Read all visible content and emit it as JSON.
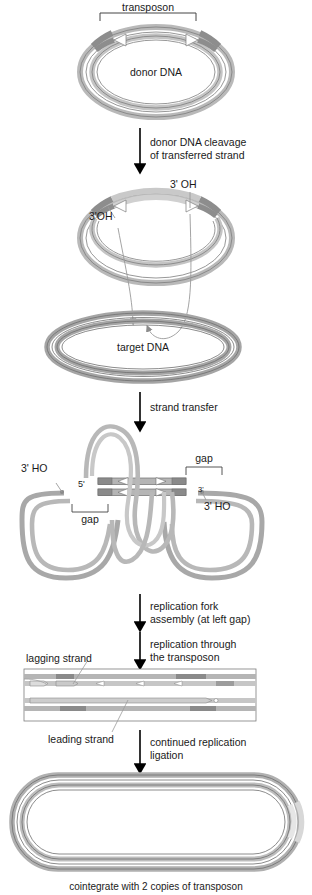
{
  "figure": {
    "title_caption": "cointegrate with 2 copies of transposon",
    "colors": {
      "dna_light": "#cfcfcf",
      "dna_mid": "#a8a8a8",
      "dna_dark": "#8a8a8a",
      "transposon_dark": "#8f8f8f",
      "outline": "#6e6e6e",
      "text": "#1a1a1a",
      "arrow": "#000000",
      "thin_leader": "#9a9a9a"
    }
  },
  "stage1": {
    "transposon_label": "transposon",
    "donor_label": "donor DNA"
  },
  "step1": {
    "line1": "donor DNA cleavage",
    "line2": "of transferred strand"
  },
  "stage2": {
    "oh_right": "3' OH",
    "oh_left": "3'OH",
    "target_label": "target DNA"
  },
  "step2": {
    "line1": "strand transfer"
  },
  "stage3": {
    "ho_left": "3' HO",
    "five_prime": "5'",
    "gap_left": "gap",
    "gap_right": "gap",
    "three_prime": "3'",
    "ho_right": "3' HO"
  },
  "step3": {
    "line1": "replication fork",
    "line2": "assembly (at left gap)"
  },
  "step4": {
    "line1": "replication through",
    "line2": "the transposon"
  },
  "stage4": {
    "lagging_label": "lagging strand",
    "leading_label": "leading strand"
  },
  "step5": {
    "line1": "continued replication",
    "line2": "ligation"
  },
  "stage5": {
    "caption": "cointegrate with 2 copies of transposon"
  }
}
